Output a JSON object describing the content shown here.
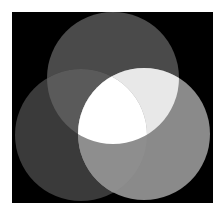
{
  "diagram": {
    "type": "venn",
    "background": {
      "x": 12,
      "y": 12,
      "width": 201,
      "height": 191,
      "color": "#000000"
    },
    "circles": [
      {
        "id": "top",
        "cx": 113,
        "cy": 78,
        "r": 66,
        "color": "#4a4a4a"
      },
      {
        "id": "left",
        "cx": 81,
        "cy": 135,
        "r": 66,
        "color": "#3a3a3a"
      },
      {
        "id": "right",
        "cx": 144,
        "cy": 134,
        "r": 66,
        "color": "#8a8a8a"
      }
    ],
    "intersections": {
      "top_left": "#5a5a5a",
      "top_right": "#e8e8e8",
      "left_right": "#8e8e8e",
      "all": "#ffffff"
    }
  }
}
